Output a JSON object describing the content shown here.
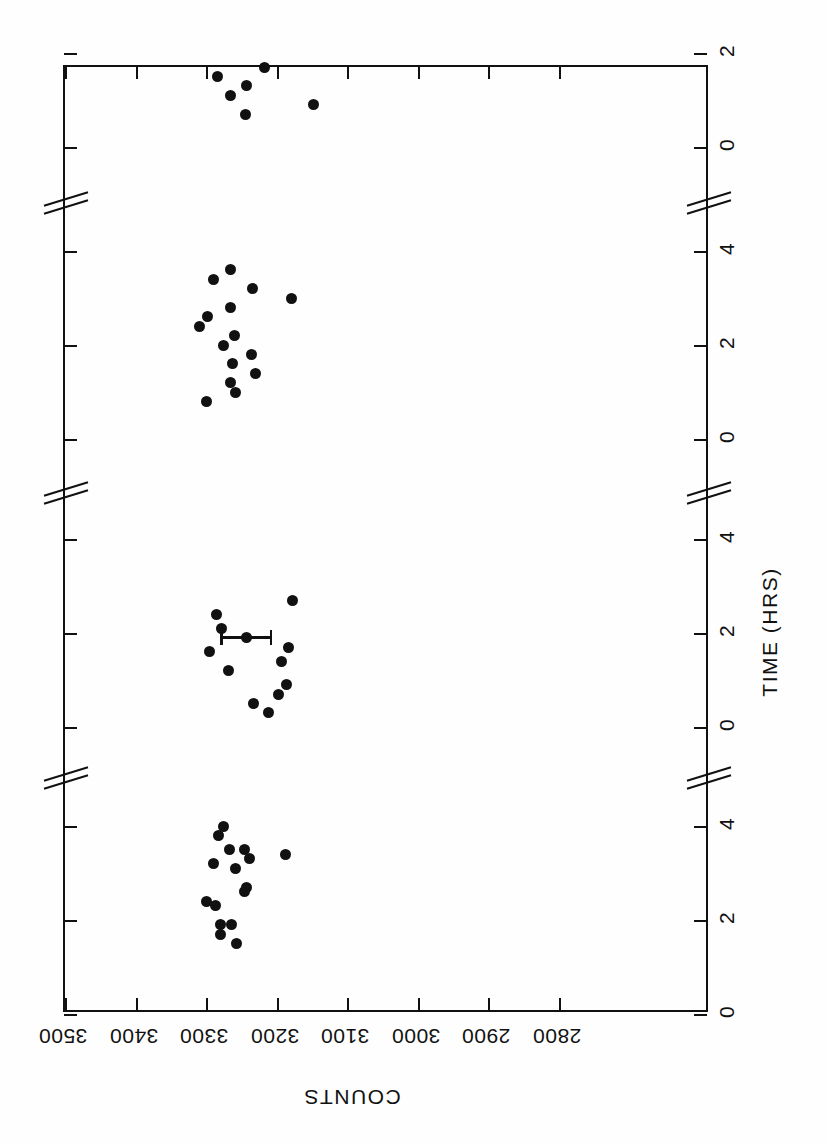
{
  "figure": {
    "orientation": "rotated-180",
    "background": "#fefefe",
    "ink_color": "#111111"
  },
  "axes": {
    "counts": {
      "title": "COUNTS",
      "ticks": [
        3500,
        3400,
        3300,
        3200,
        3100,
        3000,
        2900,
        2800
      ],
      "tick_labels": [
        "3500",
        "3400",
        "3300",
        "3200",
        "3100",
        "3000",
        "2900",
        "2800"
      ],
      "range": [
        2800,
        3500
      ]
    },
    "time": {
      "title": "TIME (HRS)",
      "tick_labels": [
        "0",
        "2",
        "4",
        "0",
        "2",
        "4",
        "0",
        "2",
        "4",
        "0",
        "2"
      ],
      "breaks": 3,
      "segments": 4,
      "unit": "HRS"
    }
  },
  "chart_data": {
    "type": "scatter",
    "title": "",
    "xlabel": "COUNTS",
    "ylabel": "TIME (HRS)",
    "xlim": [
      2800,
      3500
    ],
    "grid": false,
    "legend": null,
    "series": [
      {
        "name": "run-1",
        "points": [
          {
            "counts": 3300,
            "time": 2.4
          },
          {
            "counts": 3279,
            "time": 1.7
          },
          {
            "counts": 3287,
            "time": 2.3
          },
          {
            "counts": 3239,
            "time": 3.3
          },
          {
            "counts": 3289,
            "time": 3.2
          },
          {
            "counts": 3283,
            "time": 3.8
          },
          {
            "counts": 3275,
            "time": 4.0
          },
          {
            "counts": 3267,
            "time": 3.5
          },
          {
            "counts": 3280,
            "time": 1.9
          },
          {
            "counts": 3264,
            "time": 1.9
          },
          {
            "counts": 3257,
            "time": 1.5
          },
          {
            "counts": 3258,
            "time": 3.1
          },
          {
            "counts": 3245,
            "time": 2.6
          },
          {
            "counts": 3243,
            "time": 2.7
          },
          {
            "counts": 3245,
            "time": 3.5
          },
          {
            "counts": 3188,
            "time": 3.4
          }
        ]
      },
      {
        "name": "run-2",
        "points": [
          {
            "counts": 3285,
            "time": 2.4
          },
          {
            "counts": 3278,
            "time": 2.1
          },
          {
            "counts": 3243,
            "time": 1.9
          },
          {
            "counts": 3177,
            "time": 2.7
          },
          {
            "counts": 3295,
            "time": 1.6
          },
          {
            "counts": 3268,
            "time": 1.2
          },
          {
            "counts": 3184,
            "time": 1.7
          },
          {
            "counts": 3193,
            "time": 1.4
          },
          {
            "counts": 3186,
            "time": 0.9
          },
          {
            "counts": 3197,
            "time": 0.7
          },
          {
            "counts": 3233,
            "time": 0.5
          },
          {
            "counts": 3211,
            "time": 0.3
          }
        ],
        "error_bar": {
          "counts": 3243,
          "time": 1.9,
          "x_error": 37
        }
      },
      {
        "name": "run-3",
        "points": [
          {
            "counts": 3266,
            "time": 3.6
          },
          {
            "counts": 3290,
            "time": 3.4
          },
          {
            "counts": 3234,
            "time": 3.2
          },
          {
            "counts": 3179,
            "time": 3.0
          },
          {
            "counts": 3266,
            "time": 2.8
          },
          {
            "counts": 3298,
            "time": 2.6
          },
          {
            "counts": 3309,
            "time": 2.4
          },
          {
            "counts": 3260,
            "time": 2.2
          },
          {
            "counts": 3276,
            "time": 2.0
          },
          {
            "counts": 3236,
            "time": 1.8
          },
          {
            "counts": 3263,
            "time": 1.6
          },
          {
            "counts": 3230,
            "time": 1.4
          },
          {
            "counts": 3266,
            "time": 1.2
          },
          {
            "counts": 3259,
            "time": 1.0
          },
          {
            "counts": 3299,
            "time": 0.8
          }
        ]
      },
      {
        "name": "run-4",
        "points": [
          {
            "counts": 3284,
            "time": 1.5
          },
          {
            "counts": 3218,
            "time": 1.7
          },
          {
            "counts": 3243,
            "time": 1.3
          },
          {
            "counts": 3265,
            "time": 1.1
          },
          {
            "counts": 3244,
            "time": 0.7
          },
          {
            "counts": 3148,
            "time": 0.9
          }
        ]
      }
    ]
  }
}
